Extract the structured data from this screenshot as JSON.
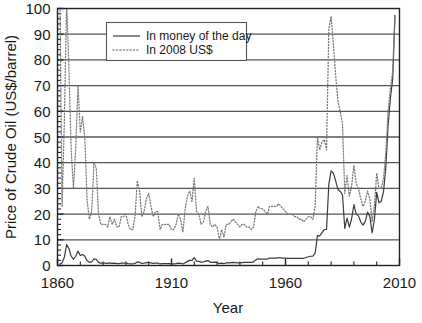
{
  "chart_data": {
    "type": "line",
    "title": "",
    "xlabel": "Year",
    "ylabel": "Price of Crude Oil (US$/barrel)",
    "xlim": [
      1860,
      2010
    ],
    "ylim": [
      0,
      100
    ],
    "xticks": [
      1860,
      1910,
      1960,
      2010
    ],
    "xtick_labels": [
      "1860",
      "1910",
      "1960",
      "2010"
    ],
    "xtick_minor_step": 10,
    "yticks": [
      0,
      10,
      20,
      30,
      40,
      50,
      60,
      70,
      80,
      90,
      100
    ],
    "ytick_labels": [
      "0",
      "10",
      "20",
      "30",
      "40",
      "50",
      "60",
      "70",
      "80",
      "90",
      "100"
    ],
    "ytick_minor_step": 2,
    "grid": "horizontal-major",
    "legend_position": "top-center",
    "series": [
      {
        "name": "In money of the day",
        "style": "solid",
        "color": "#3c3c3c",
        "x": [
          1861,
          1862,
          1863,
          1864,
          1865,
          1866,
          1867,
          1868,
          1869,
          1870,
          1871,
          1872,
          1873,
          1874,
          1875,
          1876,
          1877,
          1878,
          1879,
          1880,
          1881,
          1882,
          1883,
          1884,
          1885,
          1886,
          1887,
          1888,
          1889,
          1890,
          1891,
          1892,
          1893,
          1894,
          1895,
          1896,
          1897,
          1898,
          1899,
          1900,
          1901,
          1902,
          1903,
          1904,
          1905,
          1906,
          1907,
          1908,
          1909,
          1910,
          1911,
          1912,
          1913,
          1914,
          1915,
          1916,
          1917,
          1918,
          1919,
          1920,
          1921,
          1922,
          1923,
          1924,
          1925,
          1926,
          1927,
          1928,
          1929,
          1930,
          1931,
          1932,
          1933,
          1934,
          1935,
          1936,
          1937,
          1938,
          1939,
          1940,
          1941,
          1942,
          1943,
          1944,
          1945,
          1946,
          1947,
          1948,
          1949,
          1950,
          1951,
          1952,
          1953,
          1954,
          1955,
          1956,
          1957,
          1958,
          1959,
          1960,
          1961,
          1962,
          1963,
          1964,
          1965,
          1966,
          1967,
          1968,
          1969,
          1970,
          1971,
          1972,
          1973,
          1974,
          1975,
          1976,
          1977,
          1978,
          1979,
          1980,
          1981,
          1982,
          1983,
          1984,
          1985,
          1986,
          1987,
          1988,
          1989,
          1990,
          1991,
          1992,
          1993,
          1994,
          1995,
          1996,
          1997,
          1998,
          1999,
          2000,
          2001,
          2002,
          2003,
          2004,
          2005,
          2006,
          2007,
          2008
        ],
        "values": [
          0.5,
          1.1,
          3.2,
          8.1,
          6.6,
          3.7,
          2.4,
          3.6,
          5.6,
          3.9,
          4.3,
          3.6,
          1.8,
          1.2,
          1.4,
          2.6,
          2.4,
          1.2,
          0.9,
          0.9,
          0.9,
          0.8,
          1.0,
          0.8,
          0.9,
          0.7,
          0.7,
          0.9,
          0.9,
          0.9,
          0.7,
          0.6,
          0.6,
          0.8,
          1.4,
          1.2,
          0.8,
          0.9,
          1.1,
          1.2,
          1.0,
          0.8,
          0.9,
          0.9,
          0.6,
          0.7,
          0.7,
          0.7,
          0.7,
          0.6,
          0.6,
          0.7,
          0.9,
          0.8,
          0.6,
          1.1,
          1.6,
          2.0,
          2.0,
          3.1,
          1.7,
          1.6,
          1.3,
          1.4,
          1.7,
          1.9,
          1.3,
          1.2,
          1.3,
          1.2,
          0.7,
          0.9,
          0.7,
          1.0,
          1.0,
          1.1,
          1.2,
          1.1,
          1.0,
          1.0,
          1.1,
          1.2,
          1.2,
          1.2,
          1.2,
          1.4,
          2.2,
          2.6,
          2.5,
          2.5,
          2.5,
          2.5,
          2.9,
          2.9,
          2.9,
          2.9,
          3.1,
          3.0,
          2.9,
          2.9,
          2.8,
          2.8,
          2.8,
          2.8,
          2.8,
          2.8,
          2.8,
          2.8,
          3.1,
          3.4,
          3.6,
          3.6,
          4.8,
          11.6,
          11.5,
          12.8,
          14.0,
          14.0,
          31.6,
          36.8,
          35.9,
          32.9,
          29.6,
          28.8,
          27.5,
          14.4,
          18.4,
          14.9,
          18.2,
          23.7,
          20.0,
          19.3,
          17.0,
          15.7,
          17.2,
          20.8,
          19.1,
          12.7,
          17.9,
          28.5,
          24.4,
          25.0,
          28.8,
          38.3,
          54.5,
          65.1,
          72.4,
          97.3
        ]
      },
      {
        "name": "In 2008 US$",
        "style": "dotted",
        "color": "#7a7a7a",
        "x": [
          1861,
          1862,
          1863,
          1864,
          1865,
          1866,
          1867,
          1868,
          1869,
          1870,
          1871,
          1872,
          1873,
          1874,
          1875,
          1876,
          1877,
          1878,
          1879,
          1880,
          1881,
          1882,
          1883,
          1884,
          1885,
          1886,
          1887,
          1888,
          1889,
          1890,
          1891,
          1892,
          1893,
          1894,
          1895,
          1896,
          1897,
          1898,
          1899,
          1900,
          1901,
          1902,
          1903,
          1904,
          1905,
          1906,
          1907,
          1908,
          1909,
          1910,
          1911,
          1912,
          1913,
          1914,
          1915,
          1916,
          1917,
          1918,
          1919,
          1920,
          1921,
          1922,
          1923,
          1924,
          1925,
          1926,
          1927,
          1928,
          1929,
          1930,
          1931,
          1932,
          1933,
          1934,
          1935,
          1936,
          1937,
          1938,
          1939,
          1940,
          1941,
          1942,
          1943,
          1944,
          1945,
          1946,
          1947,
          1948,
          1949,
          1950,
          1951,
          1952,
          1953,
          1954,
          1955,
          1956,
          1957,
          1958,
          1959,
          1960,
          1961,
          1962,
          1963,
          1964,
          1965,
          1966,
          1967,
          1968,
          1969,
          1970,
          1971,
          1972,
          1973,
          1974,
          1975,
          1976,
          1977,
          1978,
          1979,
          1980,
          1981,
          1982,
          1983,
          1984,
          1985,
          1986,
          1987,
          1988,
          1989,
          1990,
          1991,
          1992,
          1993,
          1994,
          1995,
          1996,
          1997,
          1998,
          1999,
          2000,
          2001,
          2002,
          2003,
          2004,
          2005,
          2006,
          2007,
          2008
        ],
        "values": [
          111.0,
          23.0,
          56.0,
          103.0,
          77.0,
          45.0,
          30.0,
          46.0,
          70.0,
          52.0,
          58.0,
          49.0,
          25.0,
          18.0,
          21.0,
          40.0,
          38.0,
          20.0,
          16.0,
          16.0,
          16.0,
          15.0,
          19.0,
          16.0,
          18.0,
          15.0,
          15.0,
          19.0,
          19.0,
          20.0,
          16.0,
          14.0,
          14.0,
          19.0,
          33.0,
          29.0,
          19.0,
          21.0,
          26.0,
          28.0,
          23.0,
          19.0,
          21.0,
          21.0,
          14.0,
          16.0,
          16.0,
          16.0,
          16.0,
          14.0,
          14.0,
          16.0,
          20.0,
          18.0,
          13.0,
          22.0,
          27.0,
          29.0,
          25.0,
          34.0,
          21.0,
          20.0,
          16.0,
          17.0,
          21.0,
          23.0,
          16.0,
          15.0,
          16.0,
          15.0,
          10.0,
          14.0,
          11.0,
          16.0,
          16.0,
          17.0,
          18.0,
          17.0,
          16.0,
          15.0,
          16.0,
          16.0,
          15.0,
          15.0,
          14.0,
          15.0,
          21.0,
          23.0,
          22.0,
          22.0,
          21.0,
          20.0,
          23.0,
          23.0,
          23.0,
          23.0,
          24.0,
          23.0,
          22.0,
          21.0,
          20.0,
          20.0,
          20.0,
          19.0,
          19.0,
          18.0,
          18.0,
          17.0,
          18.0,
          19.0,
          19.0,
          18.0,
          23.0,
          50.0,
          45.0,
          48.0,
          49.0,
          45.0,
          92.0,
          97.0,
          86.0,
          74.0,
          64.0,
          60.0,
          55.0,
          28.0,
          35.0,
          27.0,
          31.0,
          39.0,
          32.0,
          30.0,
          26.0,
          23.0,
          25.0,
          29.0,
          26.0,
          17.0,
          23.0,
          36.0,
          30.0,
          30.0,
          34.0,
          44.0,
          60.0,
          69.0,
          75.0,
          97.0
        ]
      }
    ],
    "legend": [
      {
        "label": "In money of the day",
        "style": "solid"
      },
      {
        "label": "In 2008 US$",
        "style": "dotted"
      }
    ]
  },
  "colors": {
    "axis": "#222222",
    "gridline": "#555555",
    "series_solid": "#3c3c3c",
    "series_dotted": "#808080",
    "background": "#ffffff",
    "text": "#1a1a1a"
  }
}
